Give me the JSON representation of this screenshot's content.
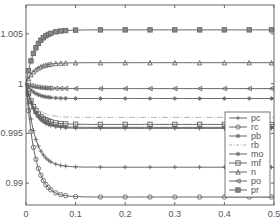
{
  "chart_data": {
    "type": "line",
    "title": "",
    "xlabel": "",
    "ylabel": "",
    "xlim": [
      0,
      0.5
    ],
    "ylim": [
      0.9878,
      1.0079
    ],
    "x_ticks": [
      "0",
      "0.1",
      "0.2",
      "0.3",
      "0.4",
      "0.5"
    ],
    "y_ticks": [
      "0.99",
      "0.995",
      "1",
      "1.005"
    ],
    "grid": false,
    "legend_position": "right-middle",
    "x": [
      0,
      0.005,
      0.01,
      0.015,
      0.02,
      0.03,
      0.04,
      0.05,
      0.07,
      0.1,
      0.15,
      0.2,
      0.25,
      0.3,
      0.35,
      0.4,
      0.45,
      0.5
    ],
    "series": [
      {
        "name": "pc",
        "marker": "plus",
        "style": "solid",
        "steady": 0.9955
      },
      {
        "name": "rc",
        "marker": "circle",
        "style": "solid",
        "steady": 0.9886
      },
      {
        "name": "pb",
        "marker": "star",
        "style": "solid",
        "steady": 0.9956
      },
      {
        "name": "rb",
        "marker": "none",
        "style": "dashdot",
        "steady": 0.9966
      },
      {
        "name": "mo",
        "marker": "x",
        "style": "solid",
        "steady": 0.9985
      },
      {
        "name": "mf",
        "marker": "square",
        "style": "solid",
        "steady": 0.9959
      },
      {
        "name": "n",
        "marker": "triangle-up",
        "style": "solid",
        "steady": 1.0021
      },
      {
        "name": "po",
        "marker": "triangle-left",
        "style": "solid",
        "steady": 0.9995
      },
      {
        "name": "pr",
        "marker": "square-top",
        "style": "solid",
        "steady": 1.0054
      }
    ],
    "series_extra": [
      {
        "name": "lower-plus",
        "marker": "plus",
        "style": "solid",
        "steady": 0.9916
      }
    ]
  },
  "legend": [
    "pc",
    "rc",
    "pb",
    "rb",
    "mo",
    "mf",
    "n",
    "po",
    "pr"
  ]
}
